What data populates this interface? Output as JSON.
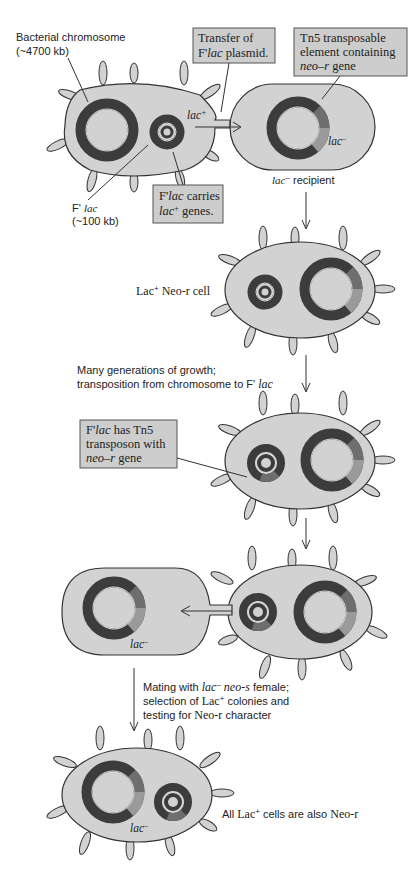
{
  "colors": {
    "cell_fill": "#d2d2d2",
    "ring_dark": "#3c3c3c",
    "ring_mid": "#6e6e6e",
    "tn5_segment": "#9a9a9a",
    "ring_line": "#d8d8d8",
    "box_fill": "#cdcdcd"
  },
  "labels": {
    "bacterial_chromosome": "Bacterial chromosome",
    "bacterial_chromosome_size": "(~4700 kb)",
    "transfer_line1": "Transfer of",
    "transfer_line2_a": "F'",
    "transfer_line2_b": "lac",
    "transfer_line2_c": " plasmid.",
    "tn5_line1": "Tn5 transposable",
    "tn5_line2": "element containing",
    "tn5_line3_a": "neo–r",
    "tn5_line3_b": " gene",
    "lac_plus": "lac",
    "lac_plus_sup": "+",
    "lac_minus": "lac",
    "lac_minus_sup": "–",
    "flac_a": "F' ",
    "flac_b": "lac",
    "flac_size": "(~100 kb)",
    "flac_carries_1a": "F'",
    "flac_carries_1b": "lac",
    "flac_carries_1c": " carries",
    "flac_carries_2a": "lac",
    "flac_carries_2b": "+",
    "flac_carries_2c": " genes.",
    "recipient_a": "lac",
    "recipient_b": "–",
    "recipient_c": " recipient",
    "lac_neo_a": "Lac",
    "lac_neo_b": "+",
    "lac_neo_c": " Neo-r cell",
    "many_gen_1": "Many generations of growth;",
    "many_gen_2a": "transposition from chromosome to F' ",
    "many_gen_2b": "lac",
    "has_tn5_1a": "F'",
    "has_tn5_1b": "lac",
    "has_tn5_1c": " has Tn5",
    "has_tn5_2": "transposon with",
    "has_tn5_3a": "neo–r",
    "has_tn5_3b": " gene",
    "mating_1a": "Mating with ",
    "mating_1b": "lac",
    "mating_1c": "–",
    "mating_1d": " neo-s",
    "mating_1e": " female;",
    "mating_2a": "selection of ",
    "mating_2b": "Lac",
    "mating_2c": "+",
    "mating_2d": " colonies and",
    "mating_3a": "testing for ",
    "mating_3b": "Neo-r",
    "mating_3c": " character",
    "final_a": "All ",
    "final_b": "Lac",
    "final_c": "+",
    "final_d": " cells are also ",
    "final_e": "Neo-r"
  }
}
